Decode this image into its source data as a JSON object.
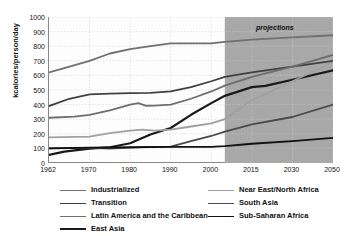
{
  "chart_data": {
    "type": "line",
    "title": "",
    "xlabel": "",
    "ylabel": "kcalories/person/day",
    "ylim": [
      0,
      1000
    ],
    "ytick_values": [
      0,
      100,
      200,
      300,
      400,
      500,
      600,
      700,
      800,
      900,
      1000
    ],
    "ytick_labels": [
      "0",
      "100",
      "200",
      "300",
      "400",
      "500",
      "600",
      "700",
      "800",
      "900",
      "1000"
    ],
    "x": [
      1962,
      1970,
      1980,
      1990,
      2000,
      2015,
      2030,
      2050
    ],
    "xtick_labels": [
      "1962",
      "1970",
      "1980",
      "1990",
      "2000",
      "2015",
      "2030",
      "2050"
    ],
    "grid": true,
    "legend_position": "bottom",
    "annotations": [
      {
        "text": "projections",
        "x_start": 2005,
        "x_end": 2050,
        "style": "shaded-region-label"
      }
    ],
    "shaded_region": {
      "label": "projections",
      "x_start": 2005,
      "x_end": 2050,
      "color": "#a8a8a8"
    },
    "series": [
      {
        "name": "Industrialized",
        "color": "#707070",
        "width": 1.8,
        "points": [
          [
            1962,
            620
          ],
          [
            1965,
            650
          ],
          [
            1970,
            700
          ],
          [
            1975,
            750
          ],
          [
            1980,
            780
          ],
          [
            1985,
            800
          ],
          [
            1990,
            820
          ],
          [
            1995,
            820
          ],
          [
            2000,
            820
          ],
          [
            2005,
            830
          ],
          [
            2015,
            845
          ],
          [
            2030,
            860
          ],
          [
            2050,
            875
          ]
        ]
      },
      {
        "name": "Transition",
        "color": "#404040",
        "width": 1.8,
        "points": [
          [
            1962,
            390
          ],
          [
            1966,
            440
          ],
          [
            1970,
            470
          ],
          [
            1975,
            475
          ],
          [
            1980,
            478
          ],
          [
            1985,
            480
          ],
          [
            1990,
            490
          ],
          [
            1995,
            520
          ],
          [
            2000,
            560
          ],
          [
            2005,
            590
          ],
          [
            2015,
            620
          ],
          [
            2030,
            660
          ],
          [
            2050,
            700
          ]
        ]
      },
      {
        "name": "Latin America and the Caribbean",
        "color": "#6e6e6e",
        "width": 1.8,
        "points": [
          [
            1962,
            310
          ],
          [
            1967,
            318
          ],
          [
            1970,
            330
          ],
          [
            1975,
            360
          ],
          [
            1980,
            400
          ],
          [
            1982,
            410
          ],
          [
            1984,
            392
          ],
          [
            1986,
            393
          ],
          [
            1990,
            400
          ],
          [
            1995,
            440
          ],
          [
            2000,
            490
          ],
          [
            2005,
            530
          ],
          [
            2015,
            590
          ],
          [
            2030,
            660
          ],
          [
            2050,
            740
          ]
        ]
      },
      {
        "name": "East Asia",
        "color": "#1a1a1a",
        "width": 2.2,
        "points": [
          [
            1962,
            55
          ],
          [
            1965,
            78
          ],
          [
            1970,
            98
          ],
          [
            1975,
            108
          ],
          [
            1980,
            135
          ],
          [
            1985,
            195
          ],
          [
            1990,
            240
          ],
          [
            1995,
            330
          ],
          [
            2000,
            410
          ],
          [
            2005,
            460
          ],
          [
            2015,
            520
          ],
          [
            2020,
            528
          ],
          [
            2030,
            570
          ],
          [
            2050,
            635
          ]
        ]
      },
      {
        "name": "Near East/North Africa",
        "color": "#a0a0a0",
        "width": 1.8,
        "points": [
          [
            1962,
            175
          ],
          [
            1970,
            180
          ],
          [
            1975,
            205
          ],
          [
            1980,
            222
          ],
          [
            1983,
            228
          ],
          [
            1986,
            222
          ],
          [
            1990,
            228
          ],
          [
            1995,
            250
          ],
          [
            2000,
            272
          ],
          [
            2005,
            300
          ],
          [
            2015,
            430
          ],
          [
            2030,
            560
          ],
          [
            2050,
            690
          ]
        ]
      },
      {
        "name": "South Asia",
        "color": "#4a4a4a",
        "width": 1.8,
        "points": [
          [
            1962,
            100
          ],
          [
            1970,
            103
          ],
          [
            1975,
            98
          ],
          [
            1980,
            105
          ],
          [
            1985,
            110
          ],
          [
            1990,
            112
          ],
          [
            1995,
            150
          ],
          [
            2000,
            185
          ],
          [
            2005,
            215
          ],
          [
            2015,
            265
          ],
          [
            2030,
            315
          ],
          [
            2050,
            400
          ]
        ]
      },
      {
        "name": "Sub-Saharan Africa",
        "color": "#111111",
        "width": 1.8,
        "points": [
          [
            1962,
            100
          ],
          [
            1970,
            105
          ],
          [
            1980,
            108
          ],
          [
            1990,
            110
          ],
          [
            2000,
            110
          ],
          [
            2005,
            115
          ],
          [
            2015,
            132
          ],
          [
            2030,
            150
          ],
          [
            2050,
            172
          ]
        ]
      }
    ]
  },
  "legend": {
    "items": [
      {
        "label": "Industrialized",
        "color": "#707070",
        "width": 1.8
      },
      {
        "label": "Transition",
        "color": "#404040",
        "width": 1.8
      },
      {
        "label": "Latin America and the Caribbean",
        "color": "#6e6e6e",
        "width": 1.8
      },
      {
        "label": "East Asia",
        "color": "#1a1a1a",
        "width": 2.2
      },
      {
        "label": "Near East/North Africa",
        "color": "#a0a0a0",
        "width": 1.8
      },
      {
        "label": "South Asia",
        "color": "#4a4a4a",
        "width": 1.8
      },
      {
        "label": "Sub-Saharan Africa",
        "color": "#111111",
        "width": 1.8
      }
    ]
  }
}
